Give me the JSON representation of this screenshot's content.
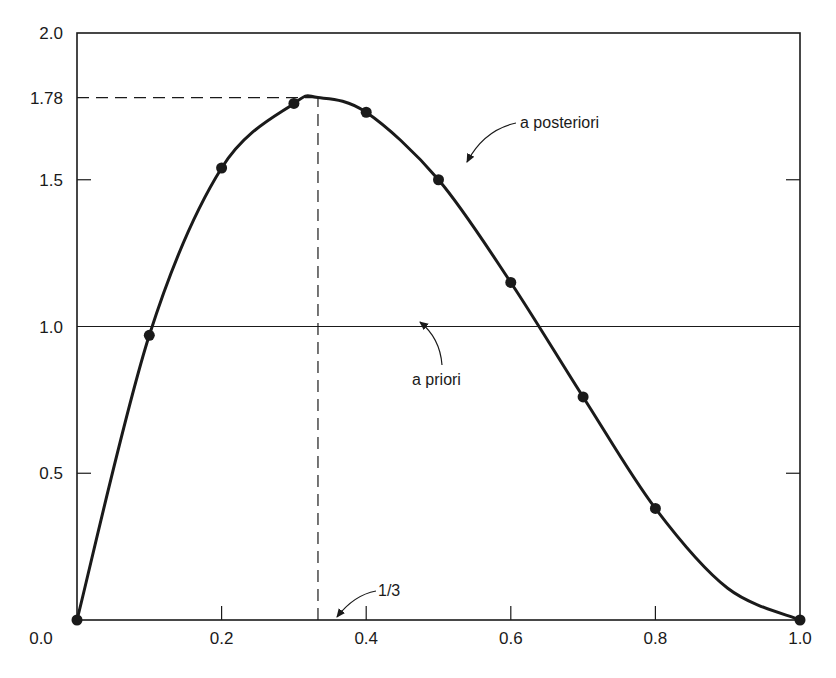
{
  "chart_data": {
    "type": "line",
    "title": "",
    "xlabel": "",
    "ylabel": "",
    "xlim": [
      0.0,
      1.0
    ],
    "ylim": [
      0.0,
      2.0
    ],
    "grid": false,
    "x_ticks": [
      0.0,
      0.2,
      0.4,
      0.6,
      0.8,
      1.0
    ],
    "x_tick_labels": [
      "0.0",
      "0.2",
      "0.4",
      "0.6",
      "0.8",
      "1.0"
    ],
    "y_ticks": [
      0.5,
      1.0,
      1.5,
      1.78,
      2.0
    ],
    "y_tick_labels": [
      "0.5",
      "1.0",
      "1.5",
      "1.78",
      "2.0"
    ],
    "series": [
      {
        "name": "a posteriori",
        "style": "solid-thick-with-markers",
        "x": [
          0.0,
          0.1,
          0.2,
          0.3,
          0.4,
          0.5,
          0.6,
          0.7,
          0.8,
          1.0
        ],
        "values": [
          0.0,
          0.97,
          1.54,
          1.76,
          1.73,
          1.5,
          1.15,
          0.76,
          0.38,
          0.0
        ]
      },
      {
        "name": "a priori",
        "style": "solid-thin",
        "x": [
          0.0,
          1.0
        ],
        "values": [
          1.0,
          1.0
        ]
      }
    ],
    "reference_lines": [
      {
        "type": "horizontal-dashed",
        "y": 1.78,
        "x_from": 0.0,
        "x_to": 0.3333
      },
      {
        "type": "vertical-dashed",
        "x": 0.3333,
        "y_from": 0.0,
        "y_to": 1.78
      }
    ],
    "annotations": [
      {
        "text": "a posteriori",
        "points_to": "posterior curve near x=0.52"
      },
      {
        "text": "a priori",
        "points_to": "horizontal line y=1.0 near x=0.48"
      },
      {
        "text": "1/3",
        "points_to": "x-axis at x=1/3"
      }
    ],
    "peak": {
      "x": "1/3",
      "y": 1.78
    }
  },
  "labels": {
    "posterior": "a posteriori",
    "prior": "a priori",
    "mode": "1/3"
  },
  "colors": {
    "ink": "#1a1a1a",
    "background": "#ffffff"
  }
}
